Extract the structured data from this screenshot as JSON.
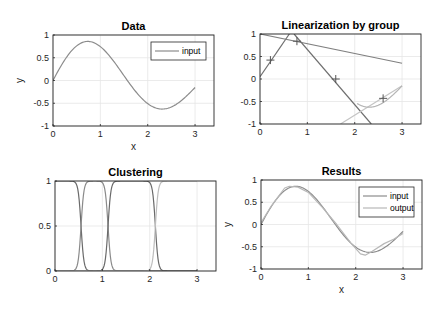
{
  "figure": {
    "background": "#ffffff"
  },
  "chart_data": [
    {
      "id": "data",
      "type": "line",
      "title": "Data",
      "xlabel": "x",
      "ylabel": "y",
      "xlim": [
        0,
        3.4
      ],
      "ylim": [
        -1,
        1
      ],
      "xticks": [
        0,
        1,
        2,
        3
      ],
      "yticks": [
        -1,
        -0.5,
        0,
        0.5,
        1
      ],
      "xtick_labels": [
        "0",
        "1",
        "2",
        "3"
      ],
      "ytick_labels": [
        "-1",
        "-0.5",
        "0",
        "0.5",
        "1"
      ],
      "grid": true,
      "legend": {
        "location": "top-right",
        "entries": [
          "input"
        ]
      },
      "series": [
        {
          "name": "input",
          "color": "#8c8c8c",
          "function": "sin(2x)*exp(-x/5)",
          "x_range": [
            0,
            3
          ]
        }
      ]
    },
    {
      "id": "linearization",
      "type": "line",
      "title": "Linearization by group",
      "xlabel": "",
      "ylabel": "",
      "xlim": [
        0,
        3.4
      ],
      "ylim": [
        -1,
        1
      ],
      "xticks": [
        0,
        1,
        2,
        3
      ],
      "yticks": [
        -1,
        -0.5,
        0,
        0.5,
        1
      ],
      "xtick_labels": [
        "0",
        "1",
        "2",
        "3"
      ],
      "ytick_labels": [
        "-1",
        "-0.5",
        "0",
        "0.5",
        "1"
      ],
      "grid": true,
      "series": [
        {
          "name": "line-1",
          "color": "#707070",
          "x": [
            0,
            0.62
          ],
          "y": [
            0.05,
            1.0
          ]
        },
        {
          "name": "line-2",
          "color": "#808080",
          "x": [
            0,
            3
          ],
          "y": [
            1.0,
            0.35
          ]
        },
        {
          "name": "line-3",
          "color": "#6e6e6e",
          "x": [
            0.72,
            2.35
          ],
          "y": [
            1.0,
            -1.0
          ]
        },
        {
          "name": "line-4",
          "color": "#c4c4c4",
          "x": [
            1.7,
            3
          ],
          "y": [
            -1.0,
            -0.15
          ]
        },
        {
          "name": "data-curve",
          "color": "#b5b5b5",
          "function": "sin(2x)*exp(-x/5)",
          "x_range": [
            2.05,
            3
          ]
        }
      ],
      "markers": {
        "symbol": "+",
        "color": "#555555",
        "points": [
          [
            0.22,
            0.42
          ],
          [
            0.78,
            0.84
          ],
          [
            1.6,
            0.0
          ],
          [
            2.6,
            -0.43
          ]
        ]
      }
    },
    {
      "id": "clustering",
      "type": "line",
      "title": "Clustering",
      "xlabel": "",
      "ylabel": "",
      "xlim": [
        0,
        3.4
      ],
      "ylim": [
        0,
        1
      ],
      "xticks": [
        0,
        1,
        2,
        3
      ],
      "yticks": [
        0,
        0.5,
        1
      ],
      "xtick_labels": [
        "0",
        "1",
        "2",
        "3"
      ],
      "ytick_labels": [
        "0",
        "0.5",
        "1"
      ],
      "grid": true,
      "series": [
        {
          "name": "cluster-1",
          "color": "#6a6a6a",
          "fall_at": 0.55
        },
        {
          "name": "cluster-2",
          "color": "#8a8a8a",
          "rise_at": 0.55,
          "fall_at": 1.12
        },
        {
          "name": "cluster-3",
          "color": "#6a6a6a",
          "rise_at": 1.12,
          "fall_at": 2.12
        },
        {
          "name": "cluster-4",
          "color": "#bdbdbd",
          "rise_at": 2.12
        }
      ],
      "transition_width": 0.12
    },
    {
      "id": "results",
      "type": "line",
      "title": "Results",
      "xlabel": "x",
      "ylabel": "y",
      "xlim": [
        0,
        3.4
      ],
      "ylim": [
        -1,
        1
      ],
      "xticks": [
        0,
        1,
        2,
        3
      ],
      "yticks": [
        -1,
        -0.5,
        0,
        0.5,
        1
      ],
      "xtick_labels": [
        "0",
        "1",
        "2",
        "3"
      ],
      "ytick_labels": [
        "-1",
        "-0.5",
        "0",
        "0.5",
        "1"
      ],
      "grid": true,
      "legend": {
        "location": "top-right",
        "entries": [
          "input",
          "output"
        ]
      },
      "series": [
        {
          "name": "input",
          "color": "#8c8c8c",
          "function": "sin(2x)*exp(-x/5)",
          "x_range": [
            0,
            3
          ]
        },
        {
          "name": "output",
          "color": "#b8b8b8",
          "x": [
            0,
            0.22,
            0.5,
            0.6,
            0.78,
            1.0,
            1.3,
            1.6,
            1.9,
            2.1,
            2.2,
            2.35,
            2.6,
            2.8,
            3.0
          ],
          "y": [
            0.04,
            0.42,
            0.82,
            0.86,
            0.84,
            0.72,
            0.38,
            0.0,
            -0.42,
            -0.66,
            -0.69,
            -0.6,
            -0.43,
            -0.33,
            -0.2
          ]
        }
      ]
    }
  ]
}
